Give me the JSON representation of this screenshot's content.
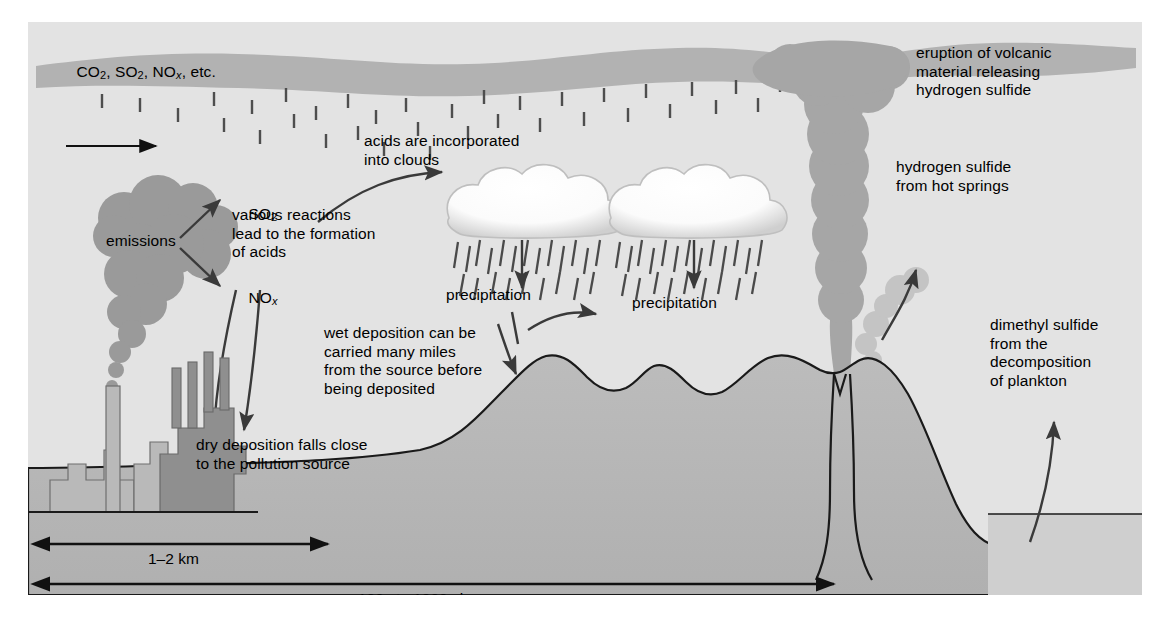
{
  "figure": {
    "kind": "sulfur-and-acid-deposition-diagram",
    "background_color": "#e3e3e3",
    "ink_color": "#1a1a1a"
  },
  "labels": {
    "gases": {
      "pre": "CO",
      "sub1": "2",
      "mid": ", SO",
      "sub2": "2",
      "mid2": ", NO",
      "subx": "x",
      "post": ", etc.",
      "plain": "CO2, SO2, NOx, etc."
    },
    "emissions": "emissions",
    "so2": {
      "base": "SO",
      "sub": "2",
      "plain": "SO2"
    },
    "nox": {
      "base": "NO",
      "sub": "x",
      "plain": "NOx"
    },
    "various_reactions": "various reactions\nlead to the formation\nof acids",
    "acids_into_clouds": "acids are incorporated\ninto clouds",
    "precipitation_left": "precipitation",
    "precipitation_right": "precipitation",
    "wet_deposition": "wet deposition can be\ncarried many miles\nfrom the source before\nbeing deposited",
    "dry_deposition": "dry deposition falls close\nto the pollution source",
    "volcanic_eruption": "eruption of volcanic\nmaterial releasing\nhydrogen sulfide",
    "hot_springs": "hydrogen sulfide\nfrom hot springs",
    "dimethyl_sulfide": "dimethyl sulfide\nfrom the\ndecomposition\nof plankton"
  },
  "scales": [
    {
      "id": "near",
      "text": "1–2 km"
    },
    {
      "id": "far",
      "text": "100s to 1000s km"
    }
  ],
  "colors": {
    "sky": "#e3e3e3",
    "haze_band": "#b2b2b2",
    "smoke_plume": "#9a9a9a",
    "volcano_plume": "#a6a6a6",
    "hot_spring_plume": "#c4c4c4",
    "terrain": "#b6b6b6",
    "building_light": "#b9b9b9",
    "building_dark": "#8f8f8f",
    "cloud_white": "#ffffff",
    "rain": "#4a4a4a",
    "sea": "#cfcfcf",
    "outline": "#1a1a1a"
  }
}
